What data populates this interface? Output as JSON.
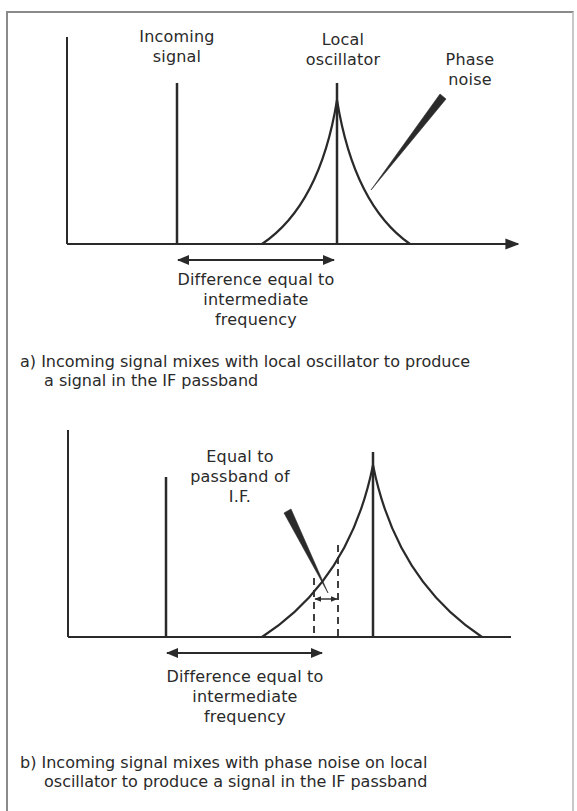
{
  "figure": {
    "panel_a": {
      "labels": {
        "incoming_signal": [
          "Incoming",
          "signal"
        ],
        "local_oscillator": [
          "Local",
          "oscillator"
        ],
        "phase_noise": [
          "Phase",
          "noise"
        ],
        "difference": [
          "Difference equal to",
          "intermediate",
          "frequency"
        ]
      },
      "caption": {
        "line1": "a) Incoming signal mixes with local oscillator to produce",
        "line2": "a signal in the IF passband"
      }
    },
    "panel_b": {
      "labels": {
        "passband": [
          "Equal to",
          "passband of",
          "I.F."
        ],
        "difference": [
          "Difference equal to",
          "intermediate",
          "frequency"
        ]
      },
      "caption": {
        "line1": "b) Incoming signal mixes with phase noise on local",
        "line2": "oscillator to produce a signal in the IF passband"
      }
    },
    "colors": {
      "ink": "#2a2a2a",
      "frame": "#8a8a8a",
      "background": "#ffffff"
    }
  }
}
